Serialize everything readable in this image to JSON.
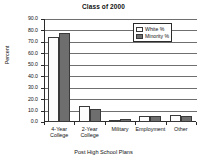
{
  "chart_data": {
    "type": "bar",
    "title": "Class of 2000",
    "xlabel": "Post High School Plans",
    "ylabel": "Percent",
    "categories": [
      "4-Year College",
      "2-Year College",
      "Military",
      "Employment",
      "Other"
    ],
    "series": [
      {
        "name": "White %",
        "values": [
          74.0,
          14.0,
          2.0,
          5.0,
          6.0
        ],
        "color": "#fdfdfd"
      },
      {
        "name": "Minority %",
        "values": [
          78.0,
          11.0,
          3.0,
          5.0,
          5.0
        ],
        "color": "#6e6e6e"
      }
    ],
    "ylim": [
      0.0,
      90.0
    ],
    "ytick_labels": [
      "90.0",
      "80.0",
      "70.0",
      "60.0",
      "50.0",
      "40.0",
      "30.0",
      "20.0",
      "10.0",
      "0.0"
    ],
    "ytick_values": [
      90,
      80,
      70,
      60,
      50,
      40,
      30,
      20,
      10,
      0
    ],
    "grid": true,
    "legend_position": "top-right"
  }
}
